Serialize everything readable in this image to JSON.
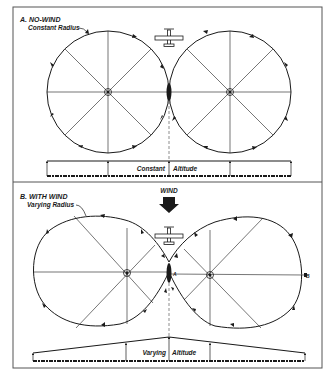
{
  "panel_a": {
    "title": "A. NO-WIND",
    "radius_label": "Constant Radius",
    "altitude_label_1": "Constant",
    "altitude_label_2": "Altitude"
  },
  "panel_b": {
    "title": "B. WITH WIND",
    "radius_label": "Varying Radius",
    "wind_label": "WIND",
    "altitude_label_1": "Varying",
    "altitude_label_2": "Altitude",
    "point_a": "A",
    "point_b": "B"
  },
  "colors": {
    "ink": "#1a1a1a",
    "frame": "#555555",
    "background": "#ffffff"
  }
}
